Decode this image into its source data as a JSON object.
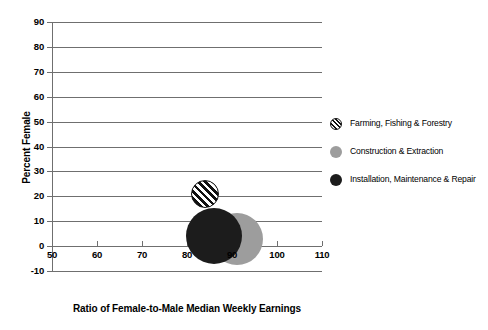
{
  "chart_data": {
    "type": "scatter",
    "title": "",
    "xlabel": "Ratio of Female-to-Male Median Weekly Earnings",
    "ylabel": "Percent Female",
    "xlim": [
      50,
      110
    ],
    "ylim": [
      -10,
      90
    ],
    "xticks": [
      50,
      60,
      70,
      80,
      90,
      100,
      110
    ],
    "yticks": [
      -10,
      0,
      10,
      20,
      30,
      40,
      50,
      60,
      70,
      80,
      90
    ],
    "grid": true,
    "legend_position": "right",
    "points": [
      {
        "name": "Farming, Fishing & Forestry",
        "x": 84,
        "y": 21,
        "size": 28,
        "marker": "striped-circle",
        "color": "#111111"
      },
      {
        "name": "Construction & Extraction",
        "x": 91,
        "y": 3,
        "size": 52,
        "marker": "filled-circle",
        "color": "#9d9d9d"
      },
      {
        "name": "Installation, Maintenance & Repair",
        "x": 86,
        "y": 4,
        "size": 56,
        "marker": "filled-circle",
        "color": "#1c1c1c"
      }
    ],
    "xtick_labels": [
      "50",
      "60",
      "70",
      "80",
      "90",
      "100",
      "110"
    ],
    "ytick_labels": [
      "-10",
      "0",
      "10",
      "20",
      "30",
      "40",
      "50",
      "60",
      "70",
      "80",
      "90"
    ]
  },
  "legend": {
    "items": [
      {
        "label": "Farming, Fishing & Forestry",
        "marker": "striped-circle-icon"
      },
      {
        "label": "Construction & Extraction",
        "marker": "gray-circle-icon"
      },
      {
        "label": "Installation, Maintenance & Repair",
        "marker": "black-circle-icon"
      }
    ]
  },
  "axes": {
    "x_title": "Ratio of Female-to-Male Median Weekly Earnings",
    "y_title": "Percent Female"
  }
}
